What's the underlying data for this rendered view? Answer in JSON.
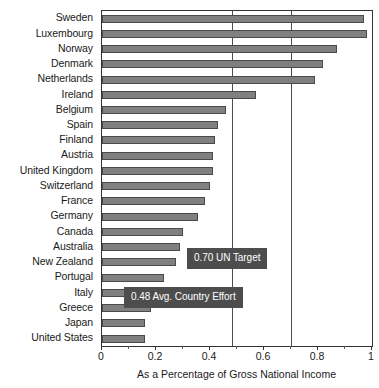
{
  "chart_data": {
    "type": "bar",
    "orientation": "horizontal",
    "title": "",
    "xlabel": "As a Percentage of Gross National Income",
    "ylabel": "",
    "xlim": [
      0,
      1
    ],
    "xticks": [
      0,
      0.2,
      0.4,
      0.6,
      0.8,
      1
    ],
    "xticklabels": [
      "0",
      "0.2",
      "0.4",
      "0.6",
      "0.8",
      "1"
    ],
    "grid": false,
    "legend": "none",
    "bar_color": "#808080",
    "bar_edge_color": "#4a4a4a",
    "categories": [
      "Sweden",
      "Luxembourg",
      "Norway",
      "Denmark",
      "Netherlands",
      "Ireland",
      "Belgium",
      "Spain",
      "Finland",
      "Austria",
      "United Kingdom",
      "Switzerland",
      "France",
      "Germany",
      "Canada",
      "Australia",
      "New Zealand",
      "Portugal",
      "Italy",
      "Greece",
      "Japan",
      "United States"
    ],
    "values": [
      0.97,
      0.98,
      0.87,
      0.82,
      0.79,
      0.57,
      0.46,
      0.43,
      0.42,
      0.41,
      0.41,
      0.4,
      0.38,
      0.355,
      0.3,
      0.29,
      0.275,
      0.23,
      0.19,
      0.18,
      0.16,
      0.16
    ],
    "reference_lines": [
      {
        "name": "avg-country-effort",
        "value": 0.48,
        "label": "0.48 Avg. Country Effort",
        "color": "#4d4d4d"
      },
      {
        "name": "un-target",
        "value": 0.7,
        "label": "0.70 UN Target",
        "color": "#4d4d4d"
      }
    ],
    "annotations": [
      {
        "name": "un-target-callout",
        "text": "0.70 UN Target"
      },
      {
        "name": "avg-effort-callout",
        "text": "0.48 Avg. Country Effort"
      }
    ]
  }
}
